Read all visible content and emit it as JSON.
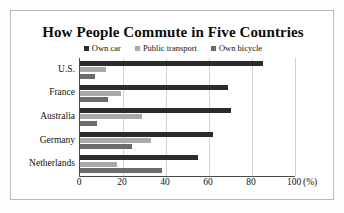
{
  "chart_data": {
    "type": "bar",
    "orientation": "horizontal",
    "title": "How People Commute in Five Countries",
    "xlabel": "",
    "ylabel": "",
    "unit_label": "(%)",
    "xlim": [
      0,
      100
    ],
    "xticks": [
      0,
      20,
      40,
      60,
      80,
      100
    ],
    "xtick_labels": [
      "0",
      "20",
      "40",
      "60",
      "80",
      "100"
    ],
    "grid": true,
    "grid_axis": "x",
    "legend_position": "top-center",
    "categories": [
      "U.S.",
      "France",
      "Australia",
      "Germany",
      "Netherlands"
    ],
    "series": [
      {
        "name": "Own car",
        "color": "#2b2b2b",
        "values": [
          85,
          69,
          70,
          62,
          55
        ]
      },
      {
        "name": "Public transport",
        "color": "#a9a9a9",
        "values": [
          12,
          19,
          29,
          33,
          17
        ]
      },
      {
        "name": "Own bicycle",
        "color": "#6b6b6b",
        "values": [
          7,
          13,
          8,
          24,
          38
        ]
      }
    ]
  },
  "colors": {
    "frame": "#b9b9b9",
    "axis": "#4a4a4a",
    "grid": "#d2d2d2",
    "background": "#ffffff",
    "text": "#111111"
  }
}
